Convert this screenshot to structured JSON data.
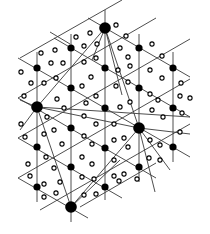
{
  "diagram": {
    "type": "triangular-lattice-superlattice",
    "colors": {
      "line": "#3a3a3a",
      "node": "#000000",
      "background": "#ffffff"
    },
    "large_nodes": [
      {
        "x": 105,
        "y": 28
      },
      {
        "x": 37,
        "y": 107
      },
      {
        "x": 139,
        "y": 128
      },
      {
        "x": 71,
        "y": 207
      }
    ],
    "small_nodes": [
      {
        "x": 71,
        "y": 48
      },
      {
        "x": 139,
        "y": 48
      },
      {
        "x": 37,
        "y": 68
      },
      {
        "x": 105,
        "y": 68
      },
      {
        "x": 173,
        "y": 68
      },
      {
        "x": 71,
        "y": 88
      },
      {
        "x": 139,
        "y": 88
      },
      {
        "x": 105,
        "y": 108
      },
      {
        "x": 173,
        "y": 108
      },
      {
        "x": 71,
        "y": 128
      },
      {
        "x": 37,
        "y": 147
      },
      {
        "x": 105,
        "y": 148
      },
      {
        "x": 173,
        "y": 147
      },
      {
        "x": 71,
        "y": 167
      },
      {
        "x": 139,
        "y": 167
      },
      {
        "x": 37,
        "y": 187
      },
      {
        "x": 105,
        "y": 187
      }
    ],
    "lattice_lines": [
      [
        37,
        52,
        37,
        202
      ],
      [
        71,
        34,
        71,
        222
      ],
      [
        105,
        10,
        105,
        200
      ],
      [
        139,
        34,
        139,
        182
      ],
      [
        173,
        52,
        173,
        162
      ],
      [
        20,
        58,
        122,
        0
      ],
      [
        18,
        98,
        156,
        18
      ],
      [
        18,
        138,
        190,
        39
      ],
      [
        18,
        178,
        190,
        79
      ],
      [
        40,
        210,
        190,
        124
      ],
      [
        80,
        207,
        156,
        163
      ],
      [
        88,
        18,
        190,
        77
      ],
      [
        54,
        38,
        190,
        117
      ],
      [
        18,
        58,
        190,
        157
      ],
      [
        18,
        98,
        156,
        178
      ],
      [
        18,
        138,
        122,
        198
      ],
      [
        18,
        178,
        88,
        218
      ],
      [
        50,
        32,
        70,
        44
      ]
    ],
    "super_lines": [
      [
        105,
        28,
        37,
        107
      ],
      [
        105,
        28,
        139,
        128
      ],
      [
        37,
        107,
        139,
        128
      ],
      [
        37,
        107,
        71,
        207
      ],
      [
        139,
        128,
        71,
        207
      ],
      [
        105,
        28,
        122,
        95
      ],
      [
        37,
        107,
        190,
        117
      ],
      [
        139,
        128,
        155,
        192
      ],
      [
        20,
        100,
        37,
        107
      ],
      [
        139,
        128,
        190,
        134
      ],
      [
        71,
        207,
        120,
        160
      ],
      [
        37,
        107,
        20,
        130
      ],
      [
        105,
        28,
        92,
        60
      ],
      [
        139,
        128,
        170,
        170
      ]
    ],
    "hollow_circles": [
      {
        "x": 76,
        "y": 37
      },
      {
        "x": 90,
        "y": 33
      },
      {
        "x": 116,
        "y": 25
      },
      {
        "x": 126,
        "y": 36
      },
      {
        "x": 41,
        "y": 53
      },
      {
        "x": 55,
        "y": 50
      },
      {
        "x": 84,
        "y": 46
      },
      {
        "x": 97,
        "y": 44
      },
      {
        "x": 120,
        "y": 48
      },
      {
        "x": 128,
        "y": 57
      },
      {
        "x": 152,
        "y": 44
      },
      {
        "x": 162,
        "y": 56
      },
      {
        "x": 21,
        "y": 72
      },
      {
        "x": 31,
        "y": 83
      },
      {
        "x": 51,
        "y": 63
      },
      {
        "x": 63,
        "y": 63
      },
      {
        "x": 84,
        "y": 62
      },
      {
        "x": 96,
        "y": 58
      },
      {
        "x": 118,
        "y": 70
      },
      {
        "x": 130,
        "y": 66
      },
      {
        "x": 150,
        "y": 70
      },
      {
        "x": 162,
        "y": 78
      },
      {
        "x": 181,
        "y": 83
      },
      {
        "x": 44,
        "y": 83
      },
      {
        "x": 56,
        "y": 78
      },
      {
        "x": 82,
        "y": 86
      },
      {
        "x": 91,
        "y": 77
      },
      {
        "x": 116,
        "y": 86
      },
      {
        "x": 128,
        "y": 82
      },
      {
        "x": 150,
        "y": 94
      },
      {
        "x": 158,
        "y": 100
      },
      {
        "x": 180,
        "y": 96
      },
      {
        "x": 190,
        "y": 98
      },
      {
        "x": 24,
        "y": 96
      },
      {
        "x": 57,
        "y": 99
      },
      {
        "x": 64,
        "y": 108
      },
      {
        "x": 86,
        "y": 103
      },
      {
        "x": 96,
        "y": 96
      },
      {
        "x": 120,
        "y": 107
      },
      {
        "x": 130,
        "y": 102
      },
      {
        "x": 152,
        "y": 110
      },
      {
        "x": 163,
        "y": 117
      },
      {
        "x": 182,
        "y": 113
      },
      {
        "x": 21,
        "y": 124
      },
      {
        "x": 47,
        "y": 117
      },
      {
        "x": 54,
        "y": 130
      },
      {
        "x": 84,
        "y": 116
      },
      {
        "x": 96,
        "y": 124
      },
      {
        "x": 114,
        "y": 124
      },
      {
        "x": 124,
        "y": 138
      },
      {
        "x": 150,
        "y": 140
      },
      {
        "x": 160,
        "y": 145
      },
      {
        "x": 180,
        "y": 132
      },
      {
        "x": 25,
        "y": 137
      },
      {
        "x": 44,
        "y": 134
      },
      {
        "x": 62,
        "y": 144
      },
      {
        "x": 84,
        "y": 136
      },
      {
        "x": 92,
        "y": 144
      },
      {
        "x": 114,
        "y": 140
      },
      {
        "x": 128,
        "y": 147
      },
      {
        "x": 149,
        "y": 158
      },
      {
        "x": 160,
        "y": 160
      },
      {
        "x": 28,
        "y": 164
      },
      {
        "x": 46,
        "y": 157
      },
      {
        "x": 54,
        "y": 168
      },
      {
        "x": 82,
        "y": 157
      },
      {
        "x": 92,
        "y": 164
      },
      {
        "x": 114,
        "y": 160
      },
      {
        "x": 124,
        "y": 174
      },
      {
        "x": 137,
        "y": 179
      },
      {
        "x": 30,
        "y": 176
      },
      {
        "x": 44,
        "y": 184
      },
      {
        "x": 60,
        "y": 182
      },
      {
        "x": 82,
        "y": 177
      },
      {
        "x": 94,
        "y": 179
      },
      {
        "x": 114,
        "y": 176
      },
      {
        "x": 119,
        "y": 181
      },
      {
        "x": 44,
        "y": 197
      },
      {
        "x": 56,
        "y": 193
      },
      {
        "x": 84,
        "y": 195
      },
      {
        "x": 96,
        "y": 194
      }
    ]
  }
}
